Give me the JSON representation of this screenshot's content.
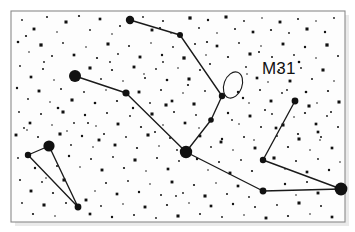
{
  "figure": {
    "kind": "star-chart",
    "background_color": "#ffffff",
    "frame_color": "#8a8a8a",
    "ink_color": "#111111"
  },
  "labels": {
    "m31": "M31"
  },
  "chart_data": {
    "type": "scatter",
    "xlabel": "",
    "ylabel": "",
    "xlim": [
      0,
      355
    ],
    "ylim": [
      0,
      232
    ],
    "grid": false,
    "legend": null,
    "annotations": [
      {
        "name": "M31",
        "text": "M31",
        "text_x": 262,
        "text_y": 74,
        "marker": "ellipse",
        "cx": 233,
        "cy": 85,
        "rx": 9,
        "ry": 13.5,
        "rotation": 20
      }
    ],
    "frame": {
      "x": 11,
      "y": 11,
      "width": 334,
      "height": 211
    },
    "named_stars": [
      {
        "name": "alpheratz",
        "x": 130,
        "y": 20,
        "r": 4.2
      },
      {
        "name": "delta-and",
        "x": 180,
        "y": 35,
        "r": 3.0
      },
      {
        "name": "mirach",
        "x": 186,
        "y": 152,
        "r": 6.2
      },
      {
        "name": "almach-mu",
        "x": 75,
        "y": 76,
        "r": 6.0
      },
      {
        "name": "nu-and",
        "x": 126,
        "y": 93,
        "r": 3.6
      },
      {
        "name": "pi-and",
        "x": 222,
        "y": 96,
        "r": 3.2
      },
      {
        "name": "upsilon-and",
        "x": 211,
        "y": 120,
        "r": 2.8
      },
      {
        "name": "triangle-apex",
        "x": 49,
        "y": 146,
        "r": 5.6
      },
      {
        "name": "triangle-left",
        "x": 28,
        "y": 155,
        "r": 3.2
      },
      {
        "name": "triangle-bottom",
        "x": 78,
        "y": 207,
        "r": 3.4
      },
      {
        "name": "right-top",
        "x": 295,
        "y": 101,
        "r": 3.4
      },
      {
        "name": "right-bend",
        "x": 263,
        "y": 160,
        "r": 3.2
      },
      {
        "name": "algenib",
        "x": 341,
        "y": 189,
        "r": 6.4
      },
      {
        "name": "lower-mid",
        "x": 263,
        "y": 191,
        "r": 3.4
      }
    ],
    "constellation_lines": [
      {
        "name": "andromeda-chain",
        "points": [
          [
            130,
            20
          ],
          [
            180,
            35
          ],
          [
            222,
            96
          ],
          [
            211,
            120
          ],
          [
            186,
            152
          ]
        ]
      },
      {
        "name": "almach-branch",
        "points": [
          [
            75,
            76
          ],
          [
            126,
            93
          ],
          [
            186,
            152
          ]
        ]
      },
      {
        "name": "pegasus-base",
        "points": [
          [
            186,
            152
          ],
          [
            263,
            191
          ],
          [
            341,
            189
          ]
        ]
      },
      {
        "name": "cassiopeia-v",
        "points": [
          [
            295,
            101
          ],
          [
            263,
            160
          ],
          [
            341,
            189
          ]
        ]
      },
      {
        "name": "triangulum",
        "points": [
          [
            28,
            155
          ],
          [
            49,
            146
          ],
          [
            78,
            207
          ],
          [
            28,
            155
          ]
        ]
      }
    ],
    "field_stars": [
      [
        22,
        20,
        0.9
      ],
      [
        34,
        29,
        1.5
      ],
      [
        47,
        17,
        1.0
      ],
      [
        57,
        32,
        0.8
      ],
      [
        66,
        22,
        1.6
      ],
      [
        79,
        16,
        1.1
      ],
      [
        90,
        30,
        0.9
      ],
      [
        100,
        19,
        1.4
      ],
      [
        112,
        34,
        0.8
      ],
      [
        120,
        26,
        1.0
      ],
      [
        143,
        17,
        0.9
      ],
      [
        152,
        30,
        1.5
      ],
      [
        163,
        21,
        1.0
      ],
      [
        171,
        33,
        0.8
      ],
      [
        190,
        18,
        1.7
      ],
      [
        199,
        28,
        0.9
      ],
      [
        208,
        20,
        1.2
      ],
      [
        217,
        33,
        0.8
      ],
      [
        226,
        17,
        1.6
      ],
      [
        235,
        29,
        1.0
      ],
      [
        244,
        21,
        0.9
      ],
      [
        253,
        32,
        1.4
      ],
      [
        262,
        18,
        0.8
      ],
      [
        271,
        30,
        1.1
      ],
      [
        280,
        22,
        1.5
      ],
      [
        289,
        33,
        0.9
      ],
      [
        298,
        19,
        1.0
      ],
      [
        307,
        29,
        1.6
      ],
      [
        316,
        21,
        0.8
      ],
      [
        325,
        32,
        1.2
      ],
      [
        334,
        18,
        0.9
      ],
      [
        18,
        42,
        1.3
      ],
      [
        29,
        52,
        0.8
      ],
      [
        41,
        45,
        1.7
      ],
      [
        52,
        56,
        1.0
      ],
      [
        63,
        43,
        0.9
      ],
      [
        74,
        55,
        1.4
      ],
      [
        86,
        47,
        0.8
      ],
      [
        97,
        58,
        1.1
      ],
      [
        108,
        44,
        1.6
      ],
      [
        118,
        54,
        0.9
      ],
      [
        129,
        46,
        1.0
      ],
      [
        140,
        57,
        1.5
      ],
      [
        151,
        43,
        0.8
      ],
      [
        162,
        55,
        1.2
      ],
      [
        173,
        47,
        0.9
      ],
      [
        184,
        58,
        1.7
      ],
      [
        195,
        44,
        1.0
      ],
      [
        206,
        55,
        0.8
      ],
      [
        217,
        46,
        1.4
      ],
      [
        228,
        57,
        1.1
      ],
      [
        239,
        43,
        0.9
      ],
      [
        250,
        54,
        1.6
      ],
      [
        261,
        46,
        0.8
      ],
      [
        272,
        57,
        1.0
      ],
      [
        283,
        44,
        1.5
      ],
      [
        294,
        55,
        0.9
      ],
      [
        305,
        47,
        1.2
      ],
      [
        316,
        58,
        0.8
      ],
      [
        327,
        45,
        1.7
      ],
      [
        338,
        56,
        1.0
      ],
      [
        20,
        66,
        0.9
      ],
      [
        31,
        77,
        1.4
      ],
      [
        43,
        69,
        1.0
      ],
      [
        54,
        80,
        0.8
      ],
      [
        90,
        68,
        1.6
      ],
      [
        101,
        79,
        0.9
      ],
      [
        112,
        70,
        1.1
      ],
      [
        123,
        81,
        0.8
      ],
      [
        134,
        67,
        1.5
      ],
      [
        145,
        78,
        1.0
      ],
      [
        156,
        69,
        0.9
      ],
      [
        167,
        80,
        1.3
      ],
      [
        178,
        68,
        0.8
      ],
      [
        189,
        79,
        1.6
      ],
      [
        200,
        70,
        1.0
      ],
      [
        246,
        67,
        0.9
      ],
      [
        257,
        78,
        1.4
      ],
      [
        268,
        82,
        0.8
      ],
      [
        279,
        70,
        1.1
      ],
      [
        290,
        81,
        1.5
      ],
      [
        301,
        68,
        0.9
      ],
      [
        312,
        79,
        1.0
      ],
      [
        323,
        70,
        1.6
      ],
      [
        334,
        81,
        0.8
      ],
      [
        17,
        88,
        1.2
      ],
      [
        28,
        99,
        0.9
      ],
      [
        39,
        91,
        1.5
      ],
      [
        50,
        102,
        0.8
      ],
      [
        61,
        89,
        1.0
      ],
      [
        72,
        100,
        1.6
      ],
      [
        84,
        92,
        0.9
      ],
      [
        95,
        103,
        1.3
      ],
      [
        106,
        90,
        0.8
      ],
      [
        117,
        101,
        1.1
      ],
      [
        139,
        92,
        1.5
      ],
      [
        150,
        103,
        0.9
      ],
      [
        161,
        90,
        1.0
      ],
      [
        172,
        101,
        1.4
      ],
      [
        183,
        93,
        0.8
      ],
      [
        194,
        104,
        1.6
      ],
      [
        205,
        91,
        0.9
      ],
      [
        238,
        92,
        1.2
      ],
      [
        249,
        103,
        0.8
      ],
      [
        260,
        90,
        1.0
      ],
      [
        271,
        101,
        1.5
      ],
      [
        282,
        93,
        0.9
      ],
      [
        306,
        92,
        1.3
      ],
      [
        317,
        103,
        0.8
      ],
      [
        328,
        91,
        1.1
      ],
      [
        339,
        102,
        1.6
      ],
      [
        19,
        112,
        0.9
      ],
      [
        30,
        123,
        1.4
      ],
      [
        41,
        114,
        1.0
      ],
      [
        52,
        125,
        0.8
      ],
      [
        63,
        112,
        1.6
      ],
      [
        74,
        123,
        0.9
      ],
      [
        85,
        115,
        1.2
      ],
      [
        96,
        126,
        0.8
      ],
      [
        107,
        113,
        1.0
      ],
      [
        118,
        124,
        1.5
      ],
      [
        130,
        116,
        0.9
      ],
      [
        141,
        127,
        1.1
      ],
      [
        152,
        114,
        1.6
      ],
      [
        163,
        125,
        0.8
      ],
      [
        174,
        112,
        1.0
      ],
      [
        185,
        123,
        1.4
      ],
      [
        196,
        115,
        0.9
      ],
      [
        228,
        113,
        1.2
      ],
      [
        239,
        124,
        0.8
      ],
      [
        250,
        116,
        1.5
      ],
      [
        261,
        127,
        1.0
      ],
      [
        272,
        114,
        0.9
      ],
      [
        283,
        125,
        1.6
      ],
      [
        294,
        117,
        0.8
      ],
      [
        305,
        113,
        1.1
      ],
      [
        316,
        124,
        1.4
      ],
      [
        327,
        116,
        0.9
      ],
      [
        338,
        127,
        1.0
      ],
      [
        16,
        135,
        1.5
      ],
      [
        27,
        130,
        0.8
      ],
      [
        38,
        137,
        1.0
      ],
      [
        60,
        134,
        1.6
      ],
      [
        71,
        145,
        0.9
      ],
      [
        82,
        136,
        1.2
      ],
      [
        93,
        147,
        0.8
      ],
      [
        104,
        134,
        1.0
      ],
      [
        115,
        145,
        1.5
      ],
      [
        126,
        137,
        0.9
      ],
      [
        137,
        148,
        1.1
      ],
      [
        148,
        135,
        1.6
      ],
      [
        159,
        146,
        0.8
      ],
      [
        170,
        138,
        1.0
      ],
      [
        200,
        136,
        1.4
      ],
      [
        211,
        147,
        0.9
      ],
      [
        222,
        139,
        1.2
      ],
      [
        233,
        150,
        0.8
      ],
      [
        244,
        137,
        1.0
      ],
      [
        255,
        148,
        1.5
      ],
      [
        277,
        136,
        0.9
      ],
      [
        288,
        147,
        1.1
      ],
      [
        299,
        139,
        1.6
      ],
      [
        310,
        150,
        0.8
      ],
      [
        321,
        137,
        1.0
      ],
      [
        332,
        148,
        1.4
      ],
      [
        18,
        158,
        0.9
      ],
      [
        69,
        156,
        1.2
      ],
      [
        80,
        167,
        0.8
      ],
      [
        91,
        159,
        1.0
      ],
      [
        102,
        170,
        1.5
      ],
      [
        113,
        157,
        0.9
      ],
      [
        124,
        168,
        1.1
      ],
      [
        135,
        160,
        1.6
      ],
      [
        146,
        171,
        0.8
      ],
      [
        157,
        158,
        1.0
      ],
      [
        168,
        169,
        1.4
      ],
      [
        179,
        161,
        0.9
      ],
      [
        197,
        159,
        1.2
      ],
      [
        208,
        170,
        0.8
      ],
      [
        219,
        162,
        1.0
      ],
      [
        230,
        173,
        1.5
      ],
      [
        241,
        160,
        0.9
      ],
      [
        252,
        171,
        1.1
      ],
      [
        274,
        158,
        1.6
      ],
      [
        285,
        169,
        0.8
      ],
      [
        296,
        161,
        1.0
      ],
      [
        307,
        172,
        1.4
      ],
      [
        318,
        159,
        0.9
      ],
      [
        329,
        170,
        1.2
      ],
      [
        340,
        162,
        0.8
      ],
      [
        20,
        180,
        1.0
      ],
      [
        31,
        191,
        1.5
      ],
      [
        42,
        182,
        0.9
      ],
      [
        53,
        193,
        1.1
      ],
      [
        64,
        180,
        1.6
      ],
      [
        95,
        191,
        0.8
      ],
      [
        106,
        183,
        1.0
      ],
      [
        117,
        194,
        1.4
      ],
      [
        128,
        181,
        0.9
      ],
      [
        139,
        192,
        1.2
      ],
      [
        150,
        184,
        0.8
      ],
      [
        161,
        195,
        1.0
      ],
      [
        172,
        182,
        1.5
      ],
      [
        183,
        193,
        0.9
      ],
      [
        194,
        185,
        1.1
      ],
      [
        205,
        196,
        1.6
      ],
      [
        216,
        183,
        0.8
      ],
      [
        227,
        194,
        1.0
      ],
      [
        238,
        186,
        1.4
      ],
      [
        249,
        197,
        0.9
      ],
      [
        285,
        184,
        1.2
      ],
      [
        296,
        195,
        0.8
      ],
      [
        307,
        182,
        1.0
      ],
      [
        318,
        193,
        1.5
      ],
      [
        22,
        203,
        0.9
      ],
      [
        33,
        214,
        1.1
      ],
      [
        44,
        205,
        1.6
      ],
      [
        55,
        216,
        0.8
      ],
      [
        66,
        203,
        1.0
      ],
      [
        90,
        214,
        1.4
      ],
      [
        101,
        206,
        0.9
      ],
      [
        112,
        217,
        1.2
      ],
      [
        123,
        204,
        0.8
      ],
      [
        134,
        215,
        1.0
      ],
      [
        145,
        207,
        1.5
      ],
      [
        156,
        218,
        0.9
      ],
      [
        167,
        205,
        1.1
      ],
      [
        178,
        216,
        1.6
      ],
      [
        189,
        203,
        0.8
      ],
      [
        200,
        214,
        1.0
      ],
      [
        211,
        206,
        1.4
      ],
      [
        222,
        217,
        0.9
      ],
      [
        233,
        204,
        1.2
      ],
      [
        244,
        215,
        0.8
      ],
      [
        255,
        207,
        1.0
      ],
      [
        266,
        218,
        1.5
      ],
      [
        277,
        205,
        0.9
      ],
      [
        288,
        216,
        1.1
      ],
      [
        299,
        203,
        1.6
      ],
      [
        310,
        214,
        0.8
      ],
      [
        321,
        206,
        1.0
      ],
      [
        332,
        217,
        1.4
      ],
      [
        26,
        36,
        1.1
      ],
      [
        44,
        62,
        0.9
      ],
      [
        58,
        108,
        1.3
      ],
      [
        67,
        131,
        0.8
      ],
      [
        88,
        123,
        1.0
      ],
      [
        99,
        140,
        1.5
      ],
      [
        110,
        62,
        0.9
      ],
      [
        133,
        108,
        1.2
      ],
      [
        144,
        74,
        0.8
      ],
      [
        155,
        132,
        1.0
      ],
      [
        166,
        105,
        1.6
      ],
      [
        177,
        150,
        0.9
      ],
      [
        188,
        85,
        1.1
      ],
      [
        199,
        128,
        0.8
      ],
      [
        210,
        64,
        1.0
      ],
      [
        221,
        142,
        1.5
      ],
      [
        232,
        120,
        0.9
      ],
      [
        243,
        98,
        1.2
      ],
      [
        254,
        140,
        0.8
      ],
      [
        265,
        110,
        1.0
      ],
      [
        276,
        128,
        1.4
      ],
      [
        287,
        90,
        0.9
      ],
      [
        298,
        134,
        1.1
      ],
      [
        309,
        106,
        1.6
      ],
      [
        320,
        140,
        0.8
      ],
      [
        331,
        112,
        1.0
      ],
      [
        35,
        168,
        1.2
      ],
      [
        46,
        178,
        0.8
      ],
      [
        57,
        166,
        1.0
      ],
      [
        86,
        200,
        1.5
      ],
      [
        163,
        62,
        0.9
      ],
      [
        207,
        42,
        1.1
      ],
      [
        247,
        74,
        0.8
      ],
      [
        299,
        62,
        1.3
      ],
      [
        176,
        196,
        0.9
      ],
      [
        259,
        52,
        1.0
      ],
      [
        318,
        132,
        1.4
      ],
      [
        24,
        128,
        0.9
      ],
      [
        160,
        28,
        1.1
      ]
    ]
  }
}
